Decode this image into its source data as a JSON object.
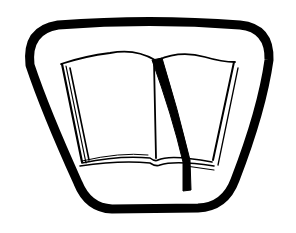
{
  "illustration": {
    "subject": "open-book-with-bookmark-emblem",
    "frame_shape": "rounded-trapezoid",
    "stroke_color": "#000000",
    "background_color": "#ffffff"
  }
}
